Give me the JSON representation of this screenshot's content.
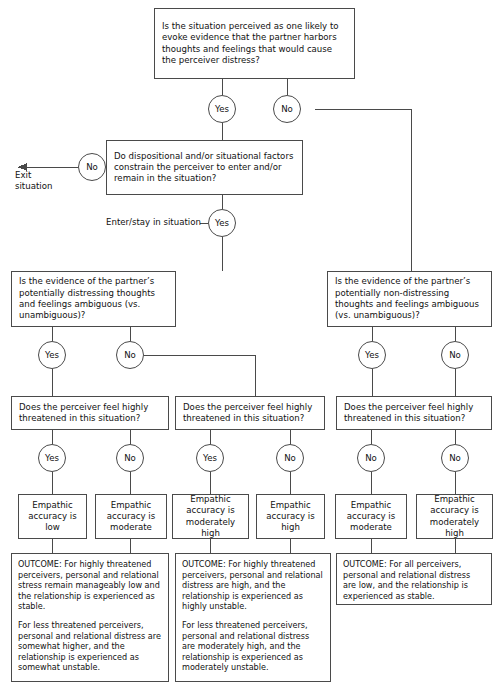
{
  "diagram": {
    "type": "flowchart",
    "stroke_color": "#4a4a4a",
    "background_color": "#ffffff",
    "text_color": "#111111"
  },
  "labels": {
    "yes": "Yes",
    "no": "No",
    "exit_situation": "Exit situation",
    "enter_stay": "Enter/stay in situation"
  },
  "questions": {
    "q_root": "Is the situation perceived as one likely to evoke evidence that the partner harbors thoughts and feelings that would cause the perceiver distress?",
    "q_constrain": "Do dispositional and/or situational factors constrain the perceiver to enter and/or remain in the situation?",
    "q_ambiguous_distressing": "Is the evidence of the partner’s potentially distressing thoughts and feelings ambiguous (vs. unambiguous)?",
    "q_ambiguous_nondistressing": "Is the evidence of the partner’s potentially non-distressing thoughts and feelings ambiguous (vs. unambiguous)?",
    "q_threatened": "Does the perceiver feel highly threatened in this situation?"
  },
  "accuracy": {
    "low": "Empathic accuracy is low",
    "moderate": "Empathic accuracy is moderate",
    "moderately_high": "Empathic accuracy is moderately high",
    "high": "Empathic accuracy is high"
  },
  "outcomes": {
    "left": {
      "p1": "OUTCOME: For highly threatened perceivers, personal and relational stress remain manageably low and the relationship is experienced as stable.",
      "p2": "For less threatened perceivers, personal and relational distress are somewhat higher, and the relationship is experienced as somewhat unstable."
    },
    "middle": {
      "p1": "OUTCOME: For highly threatened perceivers, personal and relational distress are high, and the relationship is experienced as highly unstable.",
      "p2": "For less threatened perceivers, personal and relational distress are moderately high, and the relationship is experienced as moderately unstable."
    },
    "right": {
      "p1": "OUTCOME: For all perceivers, personal and relational distress are low, and the relationship is experienced as stable."
    }
  },
  "branch_labels": {
    "root_yes": "Yes",
    "root_no": "No",
    "constrain_no": "No",
    "constrain_yes": "Yes",
    "ambL_yes": "Yes",
    "ambL_no": "No",
    "ambR_yes": "Yes",
    "ambR_no": "No",
    "thr1_yes": "Yes",
    "thr1_no": "No",
    "thr2_yes": "Yes",
    "thr2_no": "No",
    "thr3_yes": "No",
    "thr3_no": "No"
  }
}
